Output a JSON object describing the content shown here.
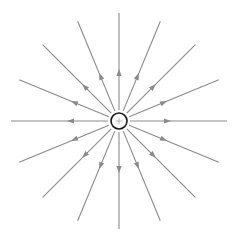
{
  "diagram": {
    "type": "electric-field-lines",
    "charge": {
      "sign": "+",
      "center": [
        119,
        121
      ],
      "radius": 8,
      "stroke_color": "#1a1a1a",
      "sign_color": "#b0b0b0"
    },
    "field_lines": {
      "count": 16,
      "angle_step_deg": 22.5,
      "direction": "outward",
      "color": "#8a8a8a",
      "inner_radius": 11,
      "outer_radius": 108,
      "arrow_distance": 48
    },
    "label": "Positive point charge field lines"
  }
}
